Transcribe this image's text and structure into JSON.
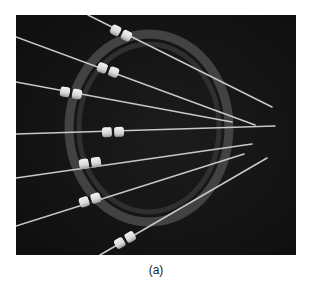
{
  "figure": {
    "caption": "(a)",
    "colors": {
      "background": "#141414",
      "ring": "#5a5a5a",
      "needle": "#c8c8c8",
      "bead": "#e6e6e6",
      "bead_band": "#1a1a1a"
    },
    "needles": [
      {
        "x1": 72,
        "y1": 0,
        "x2": 256,
        "y2": 92,
        "bx": 105,
        "by": 18
      },
      {
        "x1": 0,
        "y1": 22,
        "x2": 239,
        "y2": 110,
        "bx": 92,
        "by": 55
      },
      {
        "x1": 0,
        "y1": 67,
        "x2": 216,
        "y2": 107,
        "bx": 55,
        "by": 78
      },
      {
        "x1": 0,
        "y1": 119,
        "x2": 259,
        "y2": 111,
        "bx": 97,
        "by": 117
      },
      {
        "x1": 0,
        "y1": 163,
        "x2": 236,
        "y2": 129,
        "bx": 74,
        "by": 148
      },
      {
        "x1": 0,
        "y1": 211,
        "x2": 228,
        "y2": 139,
        "bx": 74,
        "by": 185
      },
      {
        "x1": 84,
        "y1": 240,
        "x2": 251,
        "y2": 143,
        "bx": 109,
        "by": 225
      }
    ]
  }
}
